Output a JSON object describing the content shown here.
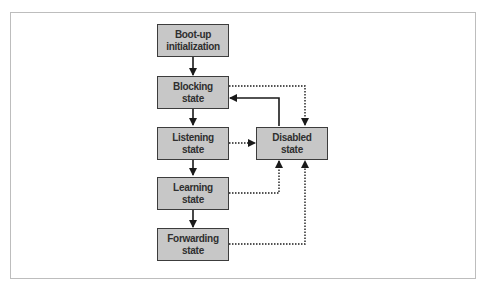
{
  "diagram": {
    "type": "state-transition",
    "nodes": [
      {
        "id": "bootup",
        "line1": "Boot-up",
        "line2": "initialization"
      },
      {
        "id": "blocking",
        "line1": "Blocking",
        "line2": "state"
      },
      {
        "id": "listening",
        "line1": "Listening",
        "line2": "state"
      },
      {
        "id": "learning",
        "line1": "Learning",
        "line2": "state"
      },
      {
        "id": "forwarding",
        "line1": "Forwarding",
        "line2": "state"
      },
      {
        "id": "disabled",
        "line1": "Disabled",
        "line2": "state"
      }
    ],
    "edges": [
      {
        "from": "bootup",
        "to": "blocking",
        "style": "solid"
      },
      {
        "from": "blocking",
        "to": "listening",
        "style": "solid"
      },
      {
        "from": "listening",
        "to": "learning",
        "style": "solid"
      },
      {
        "from": "learning",
        "to": "forwarding",
        "style": "solid"
      },
      {
        "from": "disabled",
        "to": "blocking",
        "style": "solid"
      },
      {
        "from": "blocking",
        "to": "disabled",
        "style": "dotted"
      },
      {
        "from": "listening",
        "to": "disabled",
        "style": "dotted"
      },
      {
        "from": "learning",
        "to": "disabled",
        "style": "dotted"
      },
      {
        "from": "forwarding",
        "to": "disabled",
        "style": "dotted"
      }
    ],
    "colors": {
      "box_fill": "#c7c7c7",
      "box_border": "#3c3c3c",
      "text": "#2f2f2f",
      "edge": "#1a1a1a",
      "frame": "#bdbdbd"
    }
  }
}
